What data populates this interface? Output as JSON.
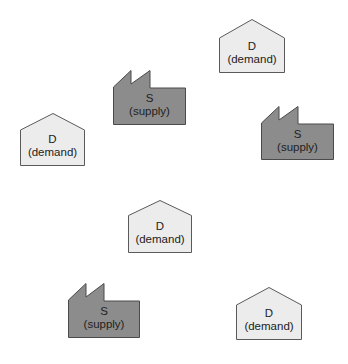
{
  "diagram": {
    "title": "",
    "colors": {
      "background": "#ffffff",
      "demand_fill": "#ececec",
      "supply_fill": "#8c8c8c",
      "outline": "#5a5a5a",
      "text": "#222222"
    },
    "legend_text": {
      "demand_letter": "D",
      "demand_word": "(demand)",
      "supply_letter": "S",
      "supply_word": "(supply)"
    },
    "nodes": [
      {
        "id": "demand-1",
        "type": "demand",
        "icon": "house-icon",
        "letter": "D",
        "word": "(demand)",
        "x": 219,
        "y": 19,
        "w": 66,
        "h": 54
      },
      {
        "id": "supply-1",
        "type": "supply",
        "icon": "factory-icon",
        "letter": "S",
        "word": "(supply)",
        "x": 113,
        "y": 70,
        "w": 73,
        "h": 55
      },
      {
        "id": "demand-2",
        "type": "demand",
        "icon": "house-icon",
        "letter": "D",
        "word": "(demand)",
        "x": 20,
        "y": 113,
        "w": 65,
        "h": 53
      },
      {
        "id": "supply-2",
        "type": "supply",
        "icon": "factory-icon",
        "letter": "S",
        "word": "(supply)",
        "x": 261,
        "y": 106,
        "w": 73,
        "h": 54
      },
      {
        "id": "demand-3",
        "type": "demand",
        "icon": "house-icon",
        "letter": "D",
        "word": "(demand)",
        "x": 128,
        "y": 200,
        "w": 64,
        "h": 53
      },
      {
        "id": "supply-3",
        "type": "supply",
        "icon": "factory-icon",
        "letter": "S",
        "word": "(supply)",
        "x": 68,
        "y": 283,
        "w": 72,
        "h": 55
      },
      {
        "id": "demand-4",
        "type": "demand",
        "icon": "house-icon",
        "letter": "D",
        "word": "(demand)",
        "x": 236,
        "y": 287,
        "w": 66,
        "h": 53
      }
    ]
  }
}
